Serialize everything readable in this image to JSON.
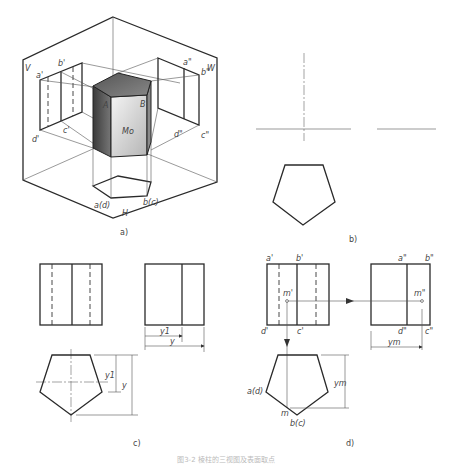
{
  "figure": {
    "caption": "图3-2 棱柱的三视图及表面取点",
    "panels": {
      "a": {
        "label": "a)",
        "planes": {
          "V": "V",
          "W": "W",
          "H": "H"
        },
        "points_3d": {
          "A": "A",
          "B": "B"
        },
        "surface": "Mo",
        "v_labels": {
          "a": "a'",
          "b": "b'",
          "c": "c'",
          "d": "d'"
        },
        "w_labels": {
          "a": "a\"",
          "b": "b\"",
          "c": "c\"",
          "d": "d\""
        },
        "h_labels": {
          "ad": "a(d)",
          "bc": "b(c)"
        }
      },
      "b": {
        "label": "b)"
      },
      "c": {
        "label": "c)",
        "dims": {
          "y1_side": "y1",
          "y_side": "y",
          "y1_top": "y1",
          "y_top": "y"
        }
      },
      "d": {
        "label": "d)",
        "v_labels": {
          "a": "a'",
          "b": "b'",
          "c": "c'",
          "d": "d'",
          "m": "m'"
        },
        "w_labels": {
          "a": "a\"",
          "b": "b\"",
          "c": "c\"",
          "d": "d\"",
          "m": "m\""
        },
        "h_labels": {
          "ad": "a(d)",
          "bc": "b(c)",
          "m": "m"
        },
        "dims": {
          "ym_side": "ym",
          "ym_top": "ym"
        }
      }
    }
  }
}
